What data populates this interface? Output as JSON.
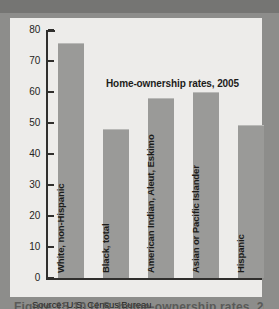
{
  "figure": {
    "title": "Home-ownership rates, 2005",
    "source": "Source: U.S. Census Bureau",
    "caption": "Figure 15.10   U.S. home-ownership rates, 2005"
  },
  "axis": {
    "tick_labels": [
      "80",
      "70",
      "60",
      "50",
      "40",
      "30",
      "20",
      "10",
      "0"
    ]
  },
  "colors": {
    "page_background": "#8d8d8b",
    "top_band": "#757573",
    "panel": "#edecea",
    "bar_fill": "#9a9a98",
    "axis": "#302f2d",
    "text": "#1c1c1a"
  },
  "chart_data": {
    "type": "bar",
    "title": "Home-ownership rates, 2005",
    "xlabel": "",
    "ylabel": "",
    "ylim": [
      0,
      80
    ],
    "yticks": [
      0,
      10,
      20,
      30,
      40,
      50,
      60,
      70,
      80
    ],
    "grid": false,
    "legend": null,
    "source": "Source: U.S. Census Bureau",
    "categories": [
      "White, non-Hispanic",
      "Black, total",
      "American Indian, Aleut, Eskimo",
      "Asian or Pacific Islander",
      "Hispanic"
    ],
    "values": [
      75.8,
      48.2,
      58.2,
      60.1,
      49.5
    ]
  }
}
